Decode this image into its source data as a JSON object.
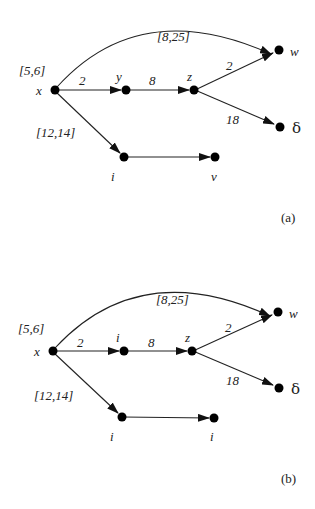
{
  "diagrams": [
    {
      "caption": "(a)",
      "nodes": {
        "x": {
          "label": "x",
          "interval": "[5,6]"
        },
        "n1": {
          "label": "y"
        },
        "z": {
          "label": "z"
        },
        "w": {
          "label": "w"
        },
        "d": {
          "label": "δ"
        },
        "n2": {
          "label": "i"
        },
        "n3": {
          "label": "v"
        }
      },
      "edges": {
        "x_w": "[8,25]",
        "x_n1": "2",
        "n1_z": "8",
        "z_w": "2",
        "z_d": "18",
        "x_n2": "[12,14]"
      }
    },
    {
      "caption": "(b)",
      "nodes": {
        "x": {
          "label": "x",
          "interval": "[5,6]"
        },
        "n1": {
          "label": "i"
        },
        "z": {
          "label": "z"
        },
        "w": {
          "label": "w"
        },
        "d": {
          "label": "δ"
        },
        "n2": {
          "label": "i"
        },
        "n3": {
          "label": "i"
        }
      },
      "edges": {
        "x_w": "[8,25]",
        "x_n1": "2",
        "n1_z": "8",
        "z_w": "2",
        "z_d": "18",
        "x_n2": "[12,14]"
      }
    }
  ]
}
